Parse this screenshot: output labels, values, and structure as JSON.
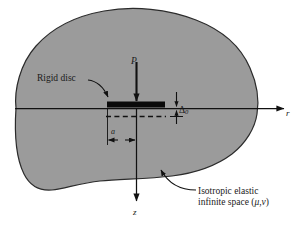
{
  "figure": {
    "type": "engineering-schematic",
    "background_color": "#ffffff",
    "body_fill_color": "#9b9b9b",
    "body_outline_color": "#2b2b2b",
    "line_color": "#111111"
  },
  "labels": {
    "rigid_disc": "Rigid disc",
    "load": "P",
    "displacement": "Δ",
    "displacement_subscript": "0",
    "radius": "a",
    "axis_r": "r",
    "axis_z": "z",
    "medium_line1": "Isotropic elastic",
    "medium_line2_prefix": "infinite space (",
    "medium_mu": "μ",
    "medium_comma": ",",
    "medium_nu": "ν",
    "medium_line2_suffix": ")"
  },
  "annotations": {
    "disc_half_width_label": "a",
    "settlement_label": "Δ0",
    "applied_force_label": "P"
  }
}
